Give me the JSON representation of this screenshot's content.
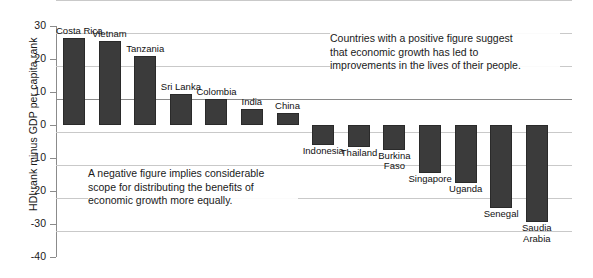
{
  "chart_data": {
    "type": "bar",
    "title": "",
    "xlabel": "",
    "ylabel": "HDI rank minus GDP per capita rank",
    "ylim": [
      -40,
      30
    ],
    "ytick_labels": [
      "30",
      "20",
      "10",
      "0",
      "-10",
      "-20",
      "-30",
      "-40"
    ],
    "ytick_values": [
      30,
      20,
      10,
      0,
      -10,
      -20,
      -30,
      -40
    ],
    "grid": true,
    "legend": "none",
    "bar_color": "#3b3b3b",
    "categories": [
      "Costa Rica",
      "Vietnam",
      "Tanzania",
      "Sri Lanka",
      "Colombia",
      "India",
      "China",
      "Indonesia",
      "Thailand",
      "Burkina Faso",
      "Singapore",
      "Uganda",
      "Senegal",
      "Saudia Arabia"
    ],
    "values": [
      26.5,
      25.5,
      21,
      9.5,
      8,
      5,
      3.5,
      -6,
      -6.8,
      -7.5,
      -14.5,
      -17.5,
      -25,
      -29.5
    ],
    "annotations": [
      "Countries with a positive figure suggest that economic growth has led to improvements in the lives of their people.",
      "A negative figure implies considerable scope for distributing the benefits of economic growth more equally."
    ]
  },
  "annotations": {
    "positive": "Countries with a positive figure suggest\nthat economic growth has led to\nimprovements in the lives of their people.",
    "negative": "A negative figure implies considerable\nscope for distributing the benefits of\neconomic growth more equally."
  }
}
